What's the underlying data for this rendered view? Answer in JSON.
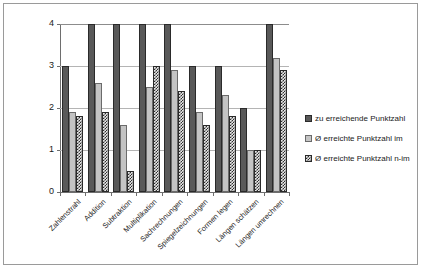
{
  "chart_data": {
    "type": "bar",
    "title": "",
    "subtitle": "",
    "xlabel": "",
    "ylabel": "",
    "ylim": [
      0,
      4
    ],
    "yticks": [
      "0",
      "1",
      "2",
      "3",
      "4"
    ],
    "grid": true,
    "legend_position": "right",
    "categories": [
      "Zahlenstrahl",
      "Addition",
      "Subtraktion",
      "Multiplikation",
      "Sachrechnungen",
      "Spiegelzeichnungen",
      "Formen legen",
      "Längen schätzen",
      "Längen umrechnen"
    ],
    "series": [
      {
        "name": "zu erreichende Punktzahl",
        "color": "#595959",
        "values": [
          3,
          4,
          4,
          4,
          4,
          3,
          3,
          2,
          4
        ]
      },
      {
        "name": "Ø erreichte Punktzahl im",
        "color": "#c4c4c4",
        "values": [
          1.9,
          2.6,
          1.6,
          2.5,
          2.9,
          1.9,
          2.3,
          1.0,
          3.2
        ]
      },
      {
        "name": "Ø erreichte Punktzahl n-im",
        "color": "#2e2e2e",
        "values": [
          1.8,
          1.9,
          0.5,
          3.0,
          2.4,
          1.6,
          1.8,
          1.0,
          2.9
        ]
      }
    ]
  }
}
